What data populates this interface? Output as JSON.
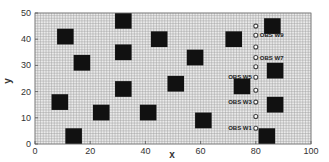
{
  "chart_data": {
    "type": "scatter",
    "title": "",
    "xlabel": "x",
    "ylabel": "y",
    "xlim": [
      0,
      100
    ],
    "ylim": [
      0,
      50
    ],
    "x_ticks": [
      "0",
      "20",
      "40",
      "60",
      "80",
      "100"
    ],
    "y_ticks": [
      "0",
      "10",
      "20",
      "30",
      "40",
      "50"
    ],
    "grid": true,
    "grid_spacing": 1,
    "legend": null,
    "series": [
      {
        "name": "obstacles",
        "marker": "filled-square",
        "size_units": 6,
        "color": "#111111",
        "points": [
          {
            "x": 11,
            "y": 41
          },
          {
            "x": 17,
            "y": 31
          },
          {
            "x": 32,
            "y": 47
          },
          {
            "x": 32,
            "y": 35
          },
          {
            "x": 32,
            "y": 21
          },
          {
            "x": 45,
            "y": 40
          },
          {
            "x": 58,
            "y": 33
          },
          {
            "x": 72,
            "y": 40
          },
          {
            "x": 86,
            "y": 45
          },
          {
            "x": 87,
            "y": 28
          },
          {
            "x": 87,
            "y": 15
          },
          {
            "x": 84,
            "y": 3
          },
          {
            "x": 9,
            "y": 16
          },
          {
            "x": 14,
            "y": 3
          },
          {
            "x": 24,
            "y": 12
          },
          {
            "x": 41,
            "y": 12
          },
          {
            "x": 51,
            "y": 23
          },
          {
            "x": 75,
            "y": 22
          },
          {
            "x": 61,
            "y": 9
          }
        ]
      },
      {
        "name": "observation wells",
        "marker": "open-circle",
        "color": "#444444",
        "points": [
          {
            "x": 80,
            "y": 45,
            "label": ""
          },
          {
            "x": 80,
            "y": 41.5,
            "label": "OBS W9"
          },
          {
            "x": 80,
            "y": 37,
            "label": ""
          },
          {
            "x": 80,
            "y": 33,
            "label": "OBS W7"
          },
          {
            "x": 80,
            "y": 29.5,
            "label": ""
          },
          {
            "x": 80,
            "y": 25.5,
            "label": "OBS W5"
          },
          {
            "x": 80,
            "y": 20.5,
            "label": ""
          },
          {
            "x": 80,
            "y": 16,
            "label": "OBS W3"
          },
          {
            "x": 80,
            "y": 10.5,
            "label": ""
          },
          {
            "x": 80,
            "y": 6,
            "label": "OBS W1"
          }
        ]
      }
    ],
    "annotations": [
      "OBS W9",
      "OBS W7",
      "OBS W5",
      "OBS W3",
      "OBS W1"
    ]
  },
  "colors": {
    "background": "#ffffff",
    "plot_bg": "#ebebeb",
    "grid": "#9a9a9a",
    "square": "#111111",
    "circle": "#444444"
  }
}
